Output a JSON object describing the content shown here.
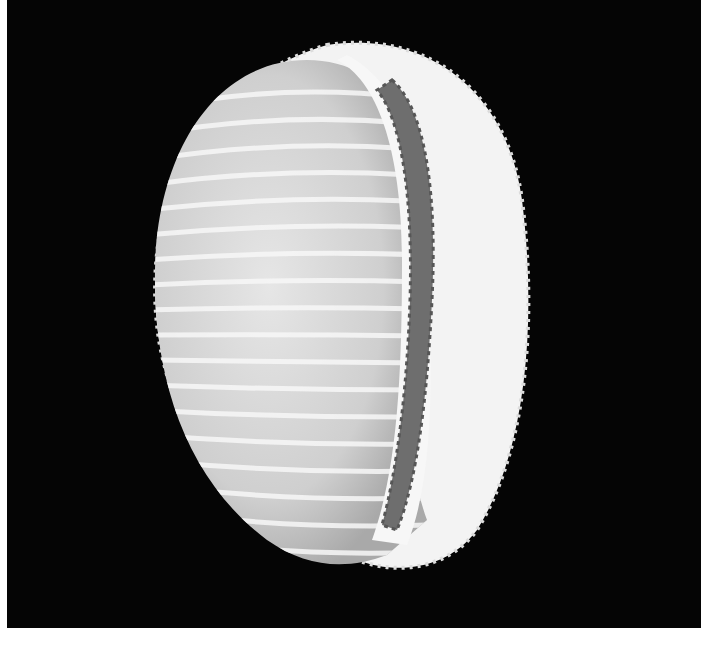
{
  "image": {
    "subject": "cowrie-like ribbed shell, aperture view",
    "background_color": "#050505",
    "shell_color": "#f4f4f4",
    "aperture_color": "#707070",
    "margin_color": "#ffffff"
  }
}
